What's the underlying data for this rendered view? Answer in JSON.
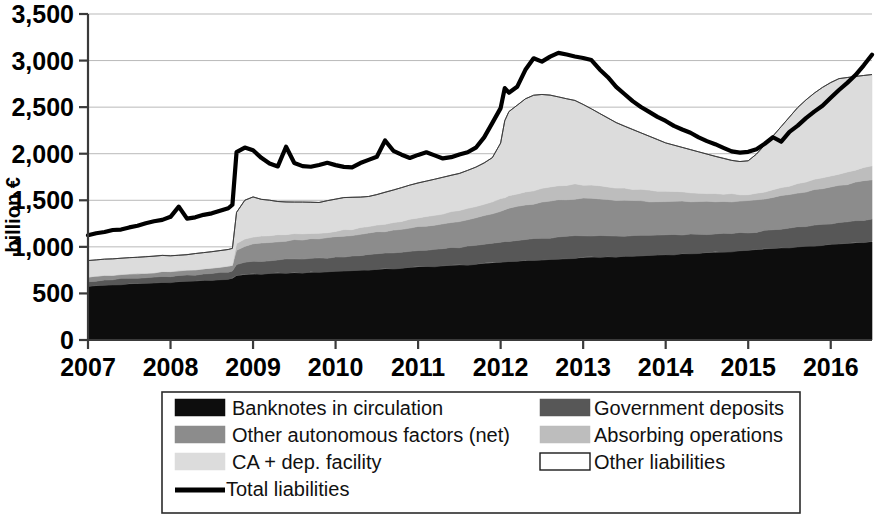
{
  "axes": {
    "y_title": "billion €",
    "y_ticks": [
      "0",
      "500",
      "1,000",
      "1,500",
      "2,000",
      "2,500",
      "3,000",
      "3,500"
    ],
    "x_ticks": [
      "2007",
      "2008",
      "2009",
      "2010",
      "2011",
      "2012",
      "2013",
      "2014",
      "2015",
      "2016"
    ]
  },
  "legend": {
    "items": [
      {
        "label": "Banknotes in circulation",
        "color": "#0d0d0d",
        "swatch": "filled"
      },
      {
        "label": "Government deposits",
        "color": "#575757",
        "swatch": "filled"
      },
      {
        "label": "Other autonomous factors (net)",
        "color": "#8c8c8c",
        "swatch": "filled"
      },
      {
        "label": "Absorbing operations",
        "color": "#bdbdbd",
        "swatch": "filled"
      },
      {
        "label": "CA + dep. facility",
        "color": "#dcdcdc",
        "swatch": "filled"
      },
      {
        "label": "Other liabilities",
        "color": "#ffffff",
        "swatch": "outline"
      },
      {
        "label": "Total liabilities",
        "color": "#000000",
        "swatch": "line"
      }
    ]
  },
  "chart_data": {
    "type": "area",
    "title": "",
    "xlabel": "",
    "ylabel": "billion €",
    "ylim": [
      0,
      3500
    ],
    "xlim": [
      2007.0,
      2016.5
    ],
    "grid": true,
    "legend_position": "bottom",
    "stacked": true,
    "x": [
      2007.0,
      2007.1,
      2007.2,
      2007.3,
      2007.4,
      2007.5,
      2007.6,
      2007.7,
      2007.8,
      2007.9,
      2008.0,
      2008.1,
      2008.2,
      2008.3,
      2008.4,
      2008.5,
      2008.6,
      2008.7,
      2008.75,
      2008.8,
      2008.9,
      2009.0,
      2009.1,
      2009.2,
      2009.3,
      2009.4,
      2009.5,
      2009.6,
      2009.7,
      2009.8,
      2009.9,
      2010.0,
      2010.1,
      2010.2,
      2010.3,
      2010.4,
      2010.5,
      2010.6,
      2010.7,
      2010.8,
      2010.9,
      2011.0,
      2011.1,
      2011.2,
      2011.3,
      2011.4,
      2011.5,
      2011.6,
      2011.7,
      2011.8,
      2011.9,
      2012.0,
      2012.05,
      2012.1,
      2012.2,
      2012.3,
      2012.4,
      2012.5,
      2012.6,
      2012.7,
      2012.8,
      2012.9,
      2013.0,
      2013.1,
      2013.2,
      2013.3,
      2013.4,
      2013.5,
      2013.6,
      2013.7,
      2013.8,
      2013.9,
      2014.0,
      2014.1,
      2014.2,
      2014.3,
      2014.4,
      2014.5,
      2014.6,
      2014.7,
      2014.8,
      2014.9,
      2015.0,
      2015.1,
      2015.2,
      2015.3,
      2015.4,
      2015.5,
      2015.6,
      2015.7,
      2015.8,
      2015.9,
      2016.0,
      2016.1,
      2016.2,
      2016.3,
      2016.4,
      2016.5
    ],
    "series": [
      {
        "name": "Banknotes in circulation",
        "color": "#0d0d0d",
        "values": [
          578,
          582,
          588,
          592,
          596,
          600,
          604,
          608,
          612,
          618,
          622,
          626,
          630,
          634,
          638,
          642,
          648,
          654,
          660,
          690,
          700,
          706,
          710,
          714,
          716,
          718,
          720,
          722,
          726,
          730,
          734,
          738,
          742,
          746,
          750,
          754,
          758,
          762,
          766,
          772,
          778,
          784,
          788,
          792,
          796,
          800,
          804,
          808,
          814,
          820,
          828,
          836,
          840,
          844,
          848,
          852,
          856,
          860,
          864,
          868,
          872,
          878,
          884,
          888,
          890,
          892,
          894,
          896,
          900,
          904,
          908,
          912,
          916,
          920,
          924,
          928,
          932,
          936,
          940,
          946,
          952,
          958,
          964,
          970,
          976,
          982,
          988,
          994,
          1000,
          1006,
          1012,
          1018,
          1024,
          1030,
          1036,
          1042,
          1048,
          1054
        ]
      },
      {
        "name": "Government deposits",
        "color": "#575757",
        "values": [
          55,
          56,
          58,
          57,
          60,
          62,
          58,
          60,
          62,
          64,
          60,
          62,
          64,
          66,
          68,
          70,
          72,
          74,
          76,
          120,
          135,
          140,
          138,
          142,
          145,
          148,
          150,
          152,
          150,
          148,
          150,
          152,
          155,
          158,
          160,
          162,
          165,
          168,
          170,
          172,
          175,
          178,
          180,
          182,
          185,
          188,
          190,
          195,
          200,
          205,
          210,
          215,
          218,
          220,
          222,
          225,
          228,
          230,
          232,
          234,
          236,
          238,
          235,
          232,
          228,
          225,
          222,
          220,
          218,
          216,
          214,
          212,
          210,
          208,
          206,
          204,
          202,
          200,
          198,
          196,
          194,
          192,
          190,
          192,
          195,
          198,
          202,
          206,
          210,
          214,
          218,
          222,
          226,
          230,
          234,
          238,
          242,
          246
        ]
      },
      {
        "name": "Other autonomous factors (net)",
        "color": "#8c8c8c",
        "values": [
          45,
          46,
          48,
          50,
          52,
          50,
          48,
          50,
          52,
          54,
          52,
          54,
          56,
          58,
          60,
          62,
          64,
          66,
          68,
          160,
          175,
          185,
          190,
          195,
          198,
          200,
          202,
          205,
          208,
          210,
          212,
          215,
          218,
          222,
          226,
          230,
          234,
          238,
          242,
          246,
          250,
          255,
          260,
          265,
          270,
          275,
          280,
          290,
          300,
          310,
          320,
          330,
          340,
          350,
          360,
          370,
          380,
          390,
          395,
          398,
          400,
          402,
          400,
          396,
          392,
          388,
          384,
          380,
          376,
          372,
          368,
          364,
          360,
          358,
          356,
          354,
          352,
          350,
          348,
          346,
          344,
          342,
          340,
          342,
          346,
          350,
          356,
          362,
          368,
          374,
          380,
          386,
          392,
          398,
          404,
          410,
          414,
          418
        ]
      },
      {
        "name": "Absorbing operations",
        "color": "#bdbdbd",
        "values": [
          0,
          0,
          0,
          0,
          0,
          0,
          0,
          0,
          0,
          0,
          0,
          0,
          0,
          0,
          0,
          0,
          0,
          0,
          0,
          60,
          70,
          75,
          72,
          70,
          68,
          66,
          64,
          62,
          60,
          58,
          60,
          62,
          64,
          66,
          68,
          70,
          74,
          78,
          82,
          86,
          90,
          94,
          98,
          102,
          106,
          110,
          114,
          118,
          122,
          126,
          130,
          134,
          136,
          138,
          140,
          142,
          144,
          146,
          148,
          150,
          152,
          154,
          150,
          146,
          142,
          138,
          134,
          130,
          126,
          122,
          118,
          114,
          110,
          106,
          102,
          98,
          94,
          90,
          86,
          82,
          78,
          74,
          70,
          72,
          76,
          80,
          86,
          92,
          98,
          104,
          110,
          116,
          122,
          128,
          134,
          140,
          146,
          152
        ]
      },
      {
        "name": "CA + dep. facility",
        "color": "#dcdcdc",
        "values": [
          175,
          176,
          174,
          172,
          170,
          172,
          178,
          176,
          174,
          172,
          170,
          168,
          166,
          170,
          172,
          174,
          176,
          178,
          180,
          340,
          420,
          430,
          400,
          380,
          360,
          350,
          345,
          340,
          335,
          330,
          340,
          345,
          350,
          340,
          330,
          325,
          330,
          340,
          350,
          360,
          370,
          375,
          380,
          385,
          390,
          395,
          400,
          410,
          420,
          440,
          470,
          600,
          820,
          900,
          950,
          1000,
          1020,
          1010,
          990,
          960,
          930,
          900,
          860,
          820,
          780,
          740,
          700,
          670,
          640,
          610,
          580,
          550,
          520,
          500,
          480,
          460,
          440,
          420,
          400,
          380,
          360,
          350,
          360,
          420,
          500,
          580,
          660,
          740,
          820,
          880,
          930,
          970,
          1000,
          1020,
          1010,
          1000,
          990,
          980
        ]
      },
      {
        "name": "Other liabilities",
        "color": "#ffffff",
        "values": [
          0,
          0,
          0,
          0,
          0,
          0,
          0,
          0,
          0,
          0,
          0,
          0,
          0,
          0,
          0,
          0,
          0,
          0,
          0,
          0,
          0,
          0,
          0,
          0,
          0,
          0,
          0,
          0,
          0,
          0,
          0,
          0,
          0,
          0,
          0,
          0,
          0,
          0,
          0,
          0,
          0,
          0,
          0,
          0,
          0,
          0,
          0,
          0,
          0,
          0,
          0,
          0,
          0,
          0,
          0,
          0,
          0,
          0,
          0,
          0,
          0,
          0,
          0,
          0,
          0,
          0,
          0,
          0,
          0,
          0,
          0,
          0,
          0,
          0,
          0,
          0,
          0,
          0,
          0,
          0,
          0,
          0,
          0,
          0,
          0,
          0,
          0,
          0,
          0,
          0,
          0,
          0,
          0,
          0,
          0,
          0,
          0,
          0
        ]
      }
    ],
    "line_series": {
      "name": "Total liabilities",
      "color": "#000000",
      "values": [
        1130,
        1145,
        1160,
        1175,
        1190,
        1210,
        1230,
        1250,
        1270,
        1290,
        1320,
        1430,
        1300,
        1320,
        1340,
        1360,
        1390,
        1420,
        1450,
        2020,
        2060,
        2040,
        1960,
        1900,
        1860,
        2080,
        1900,
        1870,
        1860,
        1880,
        1900,
        1880,
        1860,
        1850,
        1900,
        1930,
        1970,
        2140,
        2030,
        1990,
        1960,
        1990,
        2010,
        1980,
        1950,
        1960,
        1990,
        2010,
        2060,
        2180,
        2330,
        2490,
        2700,
        2660,
        2720,
        2900,
        3020,
        2990,
        3040,
        3080,
        3060,
        3040,
        3030,
        3010,
        2900,
        2820,
        2720,
        2640,
        2560,
        2500,
        2450,
        2400,
        2350,
        2300,
        2260,
        2220,
        2180,
        2130,
        2100,
        2060,
        2030,
        2010,
        2020,
        2050,
        2110,
        2180,
        2130,
        2230,
        2300,
        2380,
        2450,
        2520,
        2600,
        2680,
        2760,
        2850,
        2950,
        3060
      ]
    }
  }
}
